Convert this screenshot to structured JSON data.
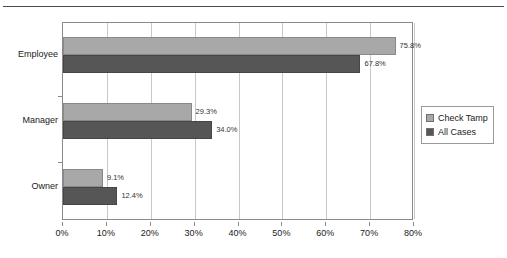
{
  "header": {
    "ghost_text": ""
  },
  "chart_data": {
    "type": "bar",
    "orientation": "horizontal",
    "title": "",
    "xlabel": "",
    "ylabel": "",
    "categories": [
      "Employee",
      "Manager",
      "Owner"
    ],
    "series": [
      {
        "name": "Check Tamp",
        "color": "#a8a8a8",
        "values": [
          75.8,
          67.8,
          29.3
        ],
        "labels": [
          "75.8%",
          "29.3%",
          "9.1%"
        ]
      },
      {
        "name": "All Cases",
        "color": "#565656",
        "values": [
          67.8,
          34.0,
          12.4
        ],
        "labels": [
          "67.8%",
          "34.0%",
          "12.4%"
        ]
      }
    ],
    "data": [
      {
        "category": "Employee",
        "check_tamp": 75.8,
        "all_cases": 67.8,
        "check_tamp_label": "75.8%",
        "all_cases_label": "67.8%"
      },
      {
        "category": "Manager",
        "check_tamp": 29.3,
        "all_cases": 34.0,
        "check_tamp_label": "29.3%",
        "all_cases_label": "34.0%"
      },
      {
        "category": "Owner",
        "check_tamp": 9.1,
        "all_cases": 12.4,
        "check_tamp_label": "9.1%",
        "all_cases_label": "12.4%"
      }
    ],
    "xlim": [
      0,
      80
    ],
    "xtick_values": [
      0,
      10,
      20,
      30,
      40,
      50,
      60,
      70,
      80
    ],
    "xtick_labels": [
      "0%",
      "10%",
      "20%",
      "30%",
      "40%",
      "50%",
      "60%",
      "70%",
      "80%"
    ],
    "grid": true,
    "grid_axis": "x",
    "legend_position": "right",
    "legend": [
      "Check Tamp",
      "All Cases"
    ]
  }
}
